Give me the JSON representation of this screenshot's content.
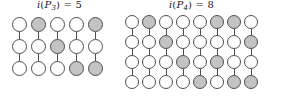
{
  "figure": {
    "background_color": "#ffffff",
    "node_stroke_color": "#4d4d4d",
    "node_white_color": "#ffffff",
    "node_shaded_color": "#c3c3c3",
    "panels": [
      {
        "id": "p3",
        "label": {
          "function": "i",
          "open_paren": "(",
          "graph": "P",
          "graph_index": "3",
          "close_paren": ")",
          "equals": "=",
          "value": "5",
          "full_text": "i(P3) = 5"
        },
        "rows": 3,
        "columns": 5,
        "states": [
          [
            "white",
            "white",
            "white"
          ],
          [
            "shaded",
            "white",
            "white"
          ],
          [
            "white",
            "shaded",
            "white"
          ],
          [
            "white",
            "white",
            "shaded"
          ],
          [
            "shaded",
            "white",
            "shaded"
          ]
        ]
      },
      {
        "id": "p4",
        "label": {
          "function": "i",
          "open_paren": "(",
          "graph": "P",
          "graph_index": "4",
          "close_paren": ")",
          "equals": "=",
          "value": "8",
          "full_text": "i(P4) = 8"
        },
        "rows": 4,
        "columns": 8,
        "states": [
          [
            "white",
            "white",
            "white",
            "white"
          ],
          [
            "shaded",
            "white",
            "white",
            "white"
          ],
          [
            "white",
            "shaded",
            "white",
            "white"
          ],
          [
            "white",
            "white",
            "shaded",
            "white"
          ],
          [
            "white",
            "white",
            "white",
            "shaded"
          ],
          [
            "shaded",
            "white",
            "shaded",
            "white"
          ],
          [
            "shaded",
            "white",
            "white",
            "shaded"
          ],
          [
            "white",
            "shaded",
            "white",
            "shaded"
          ]
        ]
      }
    ]
  }
}
